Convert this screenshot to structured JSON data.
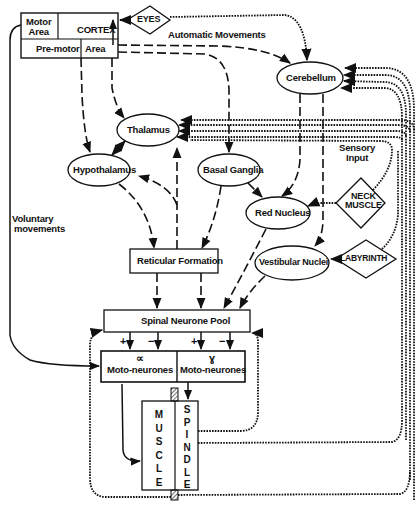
{
  "diagram": {
    "nodes": {
      "motor_area": "Motor\nArea",
      "motor_area_l1": "Motor",
      "motor_area_l2": "Area",
      "cortex": "CORTEX",
      "premotor": "Pre-motor",
      "premotor_area": "Area",
      "eyes": "EYES",
      "cerebellum": "Cerebellum",
      "thalamus": "Thalamus",
      "hypothalamus": "Hypothalamus",
      "basal_ganglia": "Basal Ganglia",
      "red_nucleus": "Red Nucleus",
      "neck_muscle_l1": "NECK",
      "neck_muscle_l2": "MUSCLE",
      "labyrinth": "LABYRINTH",
      "reticular_formation": "Reticular Formation",
      "vestibular_nuclei": "Vestibular Nuclei",
      "spinal_neurone_pool": "Spinal Neurone Pool",
      "alpha_symbol": "∝",
      "alpha_label": "Moto-neurones",
      "gamma_symbol": "ɣ",
      "gamma_label": "Moto-neurones",
      "muscle_letters": [
        "M",
        "U",
        "S",
        "C",
        "L",
        "E"
      ],
      "spindle_letters": [
        "S",
        "P",
        "I",
        "N",
        "D",
        "L",
        "E"
      ]
    },
    "annotations": {
      "automatic_movements": "Automatic Movements",
      "voluntary_l1": "Voluntary",
      "voluntary_l2": "movements",
      "sensory_l1": "Sensory",
      "sensory_l2": "Input",
      "plus_alpha": "+",
      "minus_alpha": "−",
      "plus_gamma": "+",
      "minus_gamma": "−"
    },
    "legend": {
      "dashed": "descending motor pathways",
      "dotted": "sensory feedback pathways",
      "solid": "direct pathways"
    }
  }
}
